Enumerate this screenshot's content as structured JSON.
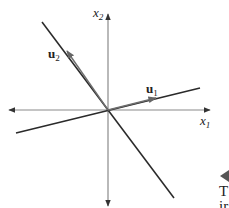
{
  "figure": {
    "type": "coordinate-plane-diagram",
    "axes": {
      "horizontal": {
        "label_base": "x",
        "label_sub": "1",
        "bidirectional": true
      },
      "vertical": {
        "label_base": "x",
        "label_sub": "2",
        "bidirectional": true
      }
    },
    "lines": [
      {
        "name": "steep-line",
        "direction": "decreasing"
      },
      {
        "name": "shallow-line",
        "direction": "increasing"
      }
    ],
    "vectors": [
      {
        "label_base": "u",
        "label_sub": "1",
        "along": "shallow-line"
      },
      {
        "label_base": "u",
        "label_sub": "2",
        "along": "steep-line"
      }
    ],
    "colors": {
      "axis": "#8a8a8a",
      "line": "#2a2a2a",
      "vector": "#6e6e6e",
      "text": "#222222"
    }
  },
  "margin": {
    "marker_icon": "left-triangle",
    "text_line1": "T",
    "text_line2": "ir"
  }
}
